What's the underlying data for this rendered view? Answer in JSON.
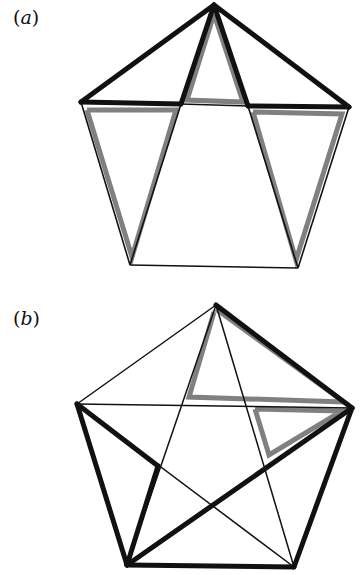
{
  "figure": {
    "panels": [
      {
        "id": "a",
        "label_open": "(",
        "label_letter": "a",
        "label_close": ")",
        "vertices": {
          "top": [
            214,
            5
          ],
          "left": [
            81,
            102
          ],
          "right": [
            349,
            107
          ],
          "bottom_left": [
            130,
            265
          ],
          "bottom_right": [
            298,
            268
          ]
        },
        "inner_points": {
          "left_cross": [
            181,
            104
          ],
          "right_cross": [
            248,
            106
          ]
        }
      },
      {
        "id": "b",
        "label_open": "(",
        "label_letter": "b",
        "label_close": ")",
        "vertices": {
          "top": [
            216,
            20
          ],
          "left": [
            77,
            119
          ],
          "right": [
            352,
            123
          ],
          "bottom_left": [
            127,
            280
          ],
          "bottom_right": [
            294,
            282
          ]
        }
      }
    ],
    "colors": {
      "thick_black": "#111111",
      "thin_black": "#111111",
      "gray_highlight": "#808080",
      "background": "#ffffff"
    }
  }
}
